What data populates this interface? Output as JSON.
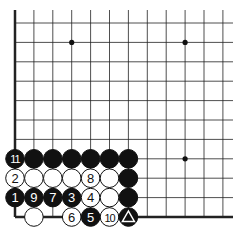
{
  "board": {
    "origin_x": 15,
    "origin_y": 23,
    "spacing_x": 18.9,
    "spacing_y": 19.4,
    "cols": 12,
    "rows": 11,
    "star_points": [
      [
        3,
        1
      ],
      [
        9,
        1
      ],
      [
        9,
        7
      ]
    ],
    "edges": [
      "left",
      "bottom"
    ]
  },
  "stones": [
    {
      "col": 0,
      "row": 7,
      "color": "black",
      "label": "11"
    },
    {
      "col": 1,
      "row": 7,
      "color": "black",
      "label": ""
    },
    {
      "col": 2,
      "row": 7,
      "color": "black",
      "label": ""
    },
    {
      "col": 3,
      "row": 7,
      "color": "black",
      "label": ""
    },
    {
      "col": 4,
      "row": 7,
      "color": "black",
      "label": ""
    },
    {
      "col": 5,
      "row": 7,
      "color": "black",
      "label": ""
    },
    {
      "col": 6,
      "row": 7,
      "color": "black",
      "label": ""
    },
    {
      "col": 0,
      "row": 8,
      "color": "white",
      "label": "2"
    },
    {
      "col": 1,
      "row": 8,
      "color": "white",
      "label": ""
    },
    {
      "col": 2,
      "row": 8,
      "color": "white",
      "label": ""
    },
    {
      "col": 3,
      "row": 8,
      "color": "white",
      "label": ""
    },
    {
      "col": 4,
      "row": 8,
      "color": "white",
      "label": "8"
    },
    {
      "col": 5,
      "row": 8,
      "color": "white",
      "label": ""
    },
    {
      "col": 6,
      "row": 8,
      "color": "black",
      "label": ""
    },
    {
      "col": 0,
      "row": 9,
      "color": "black",
      "label": "1"
    },
    {
      "col": 1,
      "row": 9,
      "color": "black",
      "label": "9"
    },
    {
      "col": 2,
      "row": 9,
      "color": "black",
      "label": "7"
    },
    {
      "col": 3,
      "row": 9,
      "color": "black",
      "label": "3"
    },
    {
      "col": 4,
      "row": 9,
      "color": "white",
      "label": "4"
    },
    {
      "col": 5,
      "row": 9,
      "color": "white",
      "label": ""
    },
    {
      "col": 6,
      "row": 9,
      "color": "black",
      "label": ""
    },
    {
      "col": 1,
      "row": 10,
      "color": "white",
      "label": ""
    },
    {
      "col": 3,
      "row": 10,
      "color": "white",
      "label": "6"
    },
    {
      "col": 4,
      "row": 10,
      "color": "black",
      "label": "5"
    },
    {
      "col": 5,
      "row": 10,
      "color": "white",
      "label": "10"
    },
    {
      "col": 6,
      "row": 10,
      "color": "black",
      "label": "triangle"
    }
  ]
}
